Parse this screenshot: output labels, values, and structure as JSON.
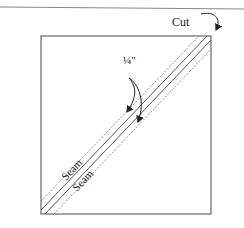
{
  "diagram": {
    "labels": {
      "cut": "Cut",
      "quarter_inch": "¼\"",
      "seam_upper": "Seam",
      "seam_lower": "Seam"
    },
    "colors": {
      "line": "#555555",
      "dashed": "#777777",
      "text": "#222222",
      "top_rule": "#888888"
    }
  }
}
